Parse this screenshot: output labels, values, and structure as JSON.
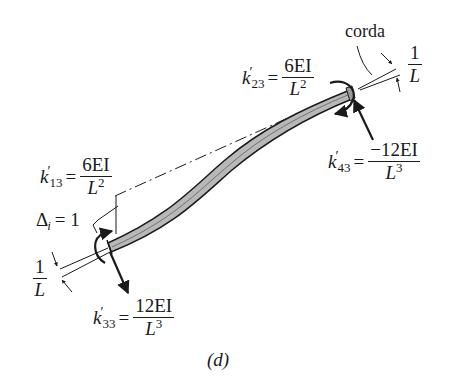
{
  "figure": {
    "caption": "(d)",
    "chord_label": "corda",
    "rotation_label_right": {
      "num": "1",
      "den": "L"
    },
    "rotation_label_left": {
      "num": "1",
      "den": "L"
    },
    "displacement_label": {
      "symbol": "Δ",
      "sub": "i",
      "value": "= 1"
    },
    "stiffness_terms": [
      {
        "id": "k23",
        "symbol": "k",
        "prime": "′",
        "sub": "23",
        "num": "6EI",
        "den_base": "L",
        "den_exp": "2"
      },
      {
        "id": "k43",
        "symbol": "k",
        "prime": "′",
        "sub": "43",
        "num": "−12EI",
        "den_base": "L",
        "den_exp": "3"
      },
      {
        "id": "k13",
        "symbol": "k",
        "prime": "′",
        "sub": "13",
        "num": "6EI",
        "den_base": "L",
        "den_exp": "2"
      },
      {
        "id": "k33",
        "symbol": "k",
        "prime": "′",
        "sub": "33",
        "num": "12EI",
        "den_base": "L",
        "den_exp": "3"
      }
    ],
    "colors": {
      "beam_fill": "#b8b8b8",
      "ink": "#1a1a1a",
      "background": "#ffffff"
    }
  }
}
